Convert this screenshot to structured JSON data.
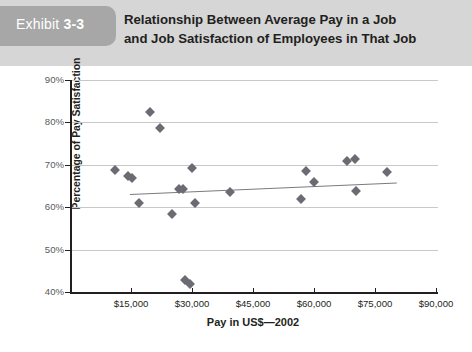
{
  "exhibit": {
    "label_word": "Exhibit",
    "label_number": "3-3",
    "title_line1": "Relationship Between Average Pay in a Job",
    "title_line2": "and Job Satisfaction of Employees in That Job",
    "header_bg": "#d6d6d6",
    "tag_bg": "#a7a7a7"
  },
  "chart_data": {
    "type": "scatter",
    "title": "Relationship Between Average Pay in a Job and Job Satisfaction of Employees in That Job",
    "xlabel": "Pay in US$—2002",
    "ylabel": "Percentage of Pay Satisfaction",
    "xlim": [
      0,
      90000
    ],
    "ylim": [
      40,
      90
    ],
    "xticks": [
      15000,
      30000,
      45000,
      60000,
      75000,
      90000
    ],
    "xtick_labels": [
      "$15,000",
      "$30,000",
      "$45,000",
      "$60,000",
      "$75,000",
      "$90,000"
    ],
    "yticks": [
      40,
      50,
      60,
      70,
      80,
      90
    ],
    "ytick_labels": [
      "40%",
      "50%",
      "60%",
      "70%",
      "80%",
      "90%"
    ],
    "grid": "horizontal",
    "legend": "none",
    "marker_shape": "diamond",
    "marker_color": "#6b6b73",
    "points": [
      {
        "x": 10500,
        "y": 68.7
      },
      {
        "x": 13700,
        "y": 67.3
      },
      {
        "x": 14800,
        "y": 66.9
      },
      {
        "x": 16400,
        "y": 61.1
      },
      {
        "x": 19300,
        "y": 82.5
      },
      {
        "x": 21600,
        "y": 78.7
      },
      {
        "x": 24600,
        "y": 58.4
      },
      {
        "x": 26400,
        "y": 64.2
      },
      {
        "x": 27400,
        "y": 64.3
      },
      {
        "x": 27900,
        "y": 42.9
      },
      {
        "x": 28900,
        "y": 42.0
      },
      {
        "x": 29600,
        "y": 69.2
      },
      {
        "x": 30200,
        "y": 61.0
      },
      {
        "x": 38900,
        "y": 63.7
      },
      {
        "x": 56400,
        "y": 61.9
      },
      {
        "x": 57600,
        "y": 68.6
      },
      {
        "x": 59600,
        "y": 65.9
      },
      {
        "x": 67700,
        "y": 70.9
      },
      {
        "x": 69600,
        "y": 71.3
      },
      {
        "x": 69800,
        "y": 63.9
      },
      {
        "x": 77400,
        "y": 68.4
      }
    ],
    "trendline": {
      "color": "#7a7a80",
      "x_start": 14200,
      "y_start": 63.2,
      "x_end": 79800,
      "y_end": 65.9
    }
  }
}
